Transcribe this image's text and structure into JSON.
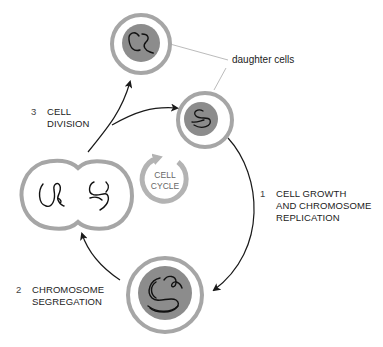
{
  "diagram": {
    "title": "Cell cycle",
    "center_label": [
      "CELL",
      "CYCLE"
    ],
    "callout": "daughter cells",
    "stages": [
      {
        "number": "1",
        "lines": [
          "CELL GROWTH",
          "AND CHROMOSOME",
          "REPLICATION"
        ]
      },
      {
        "number": "2",
        "lines": [
          "CHROMOSOME",
          "SEGREGATION"
        ]
      },
      {
        "number": "3",
        "lines": [
          "CELL",
          "DIVISION"
        ]
      }
    ],
    "colors": {
      "cell_membrane": "#a6a6a6",
      "nucleus": "#8c8c8c",
      "chromosome": "#111111",
      "arrow": "#1a1a1a",
      "cycle_ring": "#b3b3b3",
      "text": "#222222"
    }
  }
}
